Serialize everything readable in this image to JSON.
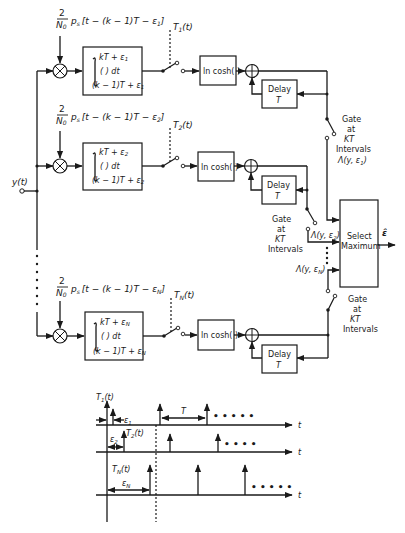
{
  "diagram": {
    "input_label": "y(t)",
    "branches": [
      {
        "id": "1",
        "reference_signal": {
          "frac_num": "2",
          "frac_den": "N",
          "frac_den_sub": "0",
          "body": "p",
          "body_sub": "s",
          "arg": "[t − (k − 1)T − ε",
          "arg_sub": "1",
          "arg_end": "]"
        },
        "integrator": {
          "upper": "kT + ε",
          "upper_sub": "1",
          "integrand": "(   ) dt",
          "lower": "(k − 1)T + ε",
          "lower_sub": "1"
        },
        "sampler_label": "T",
        "sampler_sub": "1",
        "sampler_arg": "(t)",
        "nonlinearity": "ln cosh( )",
        "delay": {
          "line1": "Delay",
          "line2": "T"
        },
        "gate": {
          "line1": "Gate",
          "line2": "at",
          "line3": "KT",
          "line4": "Intervals"
        },
        "output": "Λ(y, ε",
        "output_sub": "1",
        "output_end": ")"
      },
      {
        "id": "2",
        "reference_signal": {
          "frac_num": "2",
          "frac_den": "N",
          "frac_den_sub": "0",
          "body": "p",
          "body_sub": "s",
          "arg": "[t − (k − 1)T − ε",
          "arg_sub": "2",
          "arg_end": "]"
        },
        "integrator": {
          "upper": "kT + ε",
          "upper_sub": "2",
          "integrand": "(   ) dt",
          "lower": "(k − 1)T + ε",
          "lower_sub": "2"
        },
        "sampler_label": "T",
        "sampler_sub": "2",
        "sampler_arg": "(t)",
        "nonlinearity": "ln cosh( )",
        "delay": {
          "line1": "Delay",
          "line2": "T"
        },
        "gate": {
          "line1": "Gate",
          "line2": "at",
          "line3": "KT",
          "line4": "Intervals"
        },
        "output": "Λ(y, ε",
        "output_sub": "2",
        "output_end": ")"
      },
      {
        "id": "N",
        "reference_signal": {
          "frac_num": "2",
          "frac_den": "N",
          "frac_den_sub": "0",
          "body": "p",
          "body_sub": "s",
          "arg": "[t − (k − 1)T − ε",
          "arg_sub": "N",
          "arg_end": "]"
        },
        "integrator": {
          "upper": "kT + ε",
          "upper_sub": "N",
          "integrand": "(   ) dt",
          "lower": "(k − 1)T + ε",
          "lower_sub": "N"
        },
        "sampler_label": "T",
        "sampler_sub": "N",
        "sampler_arg": "(t)",
        "nonlinearity": "ln cosh( )",
        "delay": {
          "line1": "Delay",
          "line2": "T"
        },
        "gate": {
          "line1": "Gate",
          "line2": "at",
          "line3": "KT",
          "line4": "Intervals"
        },
        "output": "Λ(y, ε",
        "output_sub": "N",
        "output_end": ")"
      }
    ],
    "selector": {
      "line1": "Select",
      "line2": "Maximum",
      "output": "ε̂"
    }
  },
  "timing": {
    "rows": [
      {
        "label": "T",
        "sub": "1",
        "arg": "(t)",
        "offset_label": "ε",
        "offset_sub": "1",
        "period_label": "T",
        "axis_label": "t",
        "ellipsis": "• • • • •"
      },
      {
        "label": "T",
        "sub": "2",
        "arg": "(t)",
        "offset_label": "ε",
        "offset_sub": "2",
        "axis_label": "t",
        "ellipsis": "• • • •"
      },
      {
        "label": "T",
        "sub": "N",
        "arg": "(t)",
        "offset_label": "ε",
        "offset_sub": "N",
        "axis_label": "t",
        "ellipsis": "• • • • •"
      }
    ]
  }
}
